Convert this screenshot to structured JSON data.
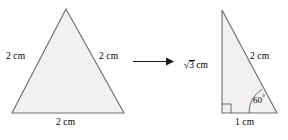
{
  "diagram": {
    "arrow": {
      "name": "transformation-arrow",
      "direction": "right"
    },
    "colors": {
      "shape_fill": "#f2f0f0",
      "shape_stroke": "#6b6b6b",
      "arrow": "#1a1a1a",
      "text": "#000000",
      "background": "#ffffff"
    },
    "left_shape": {
      "name": "equilateral-triangle",
      "labels": {
        "left_side": "2 cm",
        "right_side": "2 cm",
        "base": "2 cm"
      }
    },
    "right_shape": {
      "name": "right-triangle",
      "labels": {
        "vertical_side": "√3 cm",
        "vertical_side_radical": "√",
        "vertical_side_radicand": "3",
        "vertical_side_unit": "cm",
        "hypotenuse": "2 cm",
        "base": "1 cm",
        "angle": "60°",
        "angle_value": "60",
        "angle_unit": "°",
        "right_angle_marker": "right-angle"
      }
    }
  }
}
